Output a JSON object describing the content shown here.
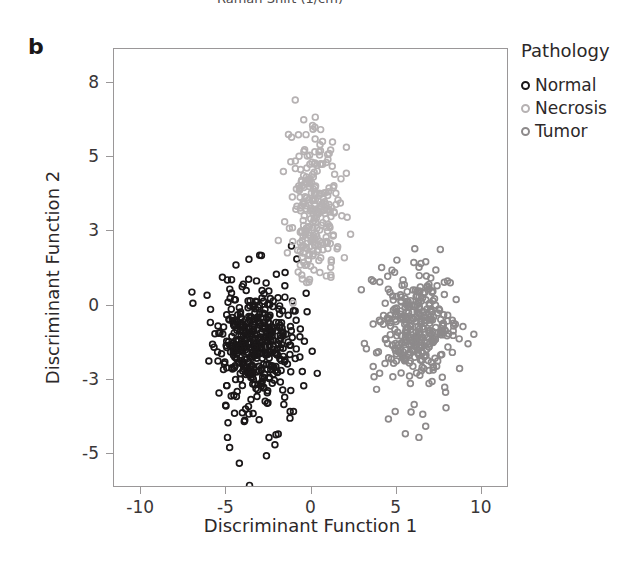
{
  "figure": {
    "panel_label": "b",
    "cropped_header_text": "Raman Shift (1/cm)",
    "ghost_caption": " ",
    "background_color": "#ffffff",
    "frame_color": "#9a9798"
  },
  "legend": {
    "title": "Pathology",
    "position": "right",
    "items": [
      {
        "label": "Normal",
        "color": "#1a1718",
        "marker": "open-circle"
      },
      {
        "label": "Necrosis",
        "color": "#b6b2b3",
        "marker": "open-circle"
      },
      {
        "label": "Tumor",
        "color": "#8d8a8b",
        "marker": "open-circle"
      }
    ]
  },
  "chart_data": {
    "type": "scatter",
    "title": "",
    "xlabel": "Discriminant Function 1",
    "ylabel": "Discriminant Function 2",
    "xlim": [
      -11.6,
      11.6
    ],
    "ylim": [
      -6.6,
      9.4
    ],
    "xticks": [
      -10,
      -5,
      0,
      5,
      10
    ],
    "yticks": [
      8,
      5,
      3,
      0,
      -3,
      -5
    ],
    "xtick_labels": [
      "-10",
      "-5",
      "0",
      "5",
      "10"
    ],
    "ytick_labels": [
      "8",
      "5",
      "3",
      "0",
      "-3",
      "-5"
    ],
    "ytick_spacing": "even",
    "grid": false,
    "legend_position": "right",
    "marker_size_px": 6,
    "marker_style": "open-circle",
    "series": [
      {
        "name": "Normal",
        "color": "#1a1718",
        "n": 430,
        "center": [
          -3.3,
          -1.6
        ],
        "spread": [
          1.05,
          1.15
        ],
        "seed": 11,
        "outliers": [
          [
            -7.0,
            0.5
          ],
          [
            -6.0,
            -2.3
          ],
          [
            -5.9,
            -0.2
          ],
          [
            -5.4,
            -3.4
          ],
          [
            -5.2,
            1.1
          ],
          [
            -4.9,
            -4.6
          ],
          [
            -4.4,
            1.6
          ],
          [
            -4.2,
            -5.3
          ],
          [
            -3.6,
            -5.9
          ],
          [
            -3.0,
            2.0
          ],
          [
            -2.6,
            -5.1
          ],
          [
            -2.1,
            -4.8
          ],
          [
            -1.5,
            1.3
          ],
          [
            -1.2,
            -3.9
          ],
          [
            -0.9,
            -2.2
          ],
          [
            -0.6,
            -1.0
          ],
          [
            -0.4,
            -3.2
          ],
          [
            -0.2,
            -0.3
          ],
          [
            0.1,
            -1.9
          ],
          [
            0.4,
            -2.8
          ]
        ]
      },
      {
        "name": "Necrosis",
        "color": "#b6b2b3",
        "n": 250,
        "center": [
          0.25,
          3.55
        ],
        "spread": [
          0.72,
          1.05
        ],
        "seed": 29,
        "outliers": [
          [
            -0.9,
            7.3
          ],
          [
            -0.4,
            6.5
          ],
          [
            -1.3,
            5.9
          ],
          [
            0.6,
            6.1
          ],
          [
            1.3,
            5.6
          ],
          [
            -1.6,
            4.6
          ],
          [
            1.8,
            4.4
          ],
          [
            -1.9,
            2.6
          ],
          [
            2.0,
            1.9
          ],
          [
            0.2,
            1.4
          ],
          [
            -0.6,
            1.6
          ],
          [
            1.2,
            1.2
          ]
        ]
      },
      {
        "name": "Tumor",
        "color": "#8d8a8b",
        "n": 330,
        "center": [
          6.3,
          -1.05
        ],
        "spread": [
          1.05,
          1.1
        ],
        "seed": 47,
        "outliers": [
          [
            3.0,
            0.6
          ],
          [
            3.3,
            -1.8
          ],
          [
            3.6,
            1.0
          ],
          [
            3.9,
            -3.3
          ],
          [
            4.2,
            1.5
          ],
          [
            4.6,
            -4.1
          ],
          [
            5.1,
            1.8
          ],
          [
            5.6,
            -4.5
          ],
          [
            6.1,
            1.7
          ],
          [
            6.8,
            -4.3
          ],
          [
            7.4,
            1.4
          ],
          [
            8.0,
            -3.8
          ],
          [
            8.6,
            0.2
          ],
          [
            9.0,
            -0.9
          ],
          [
            9.3,
            -1.6
          ],
          [
            8.8,
            -2.6
          ],
          [
            7.9,
            0.9
          ],
          [
            6.4,
            -4.6
          ],
          [
            5.0,
            -3.9
          ],
          [
            4.4,
            -2.4
          ]
        ]
      }
    ]
  }
}
